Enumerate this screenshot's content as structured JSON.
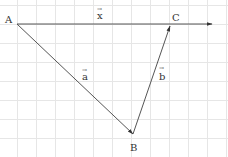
{
  "diagram": {
    "type": "vector-triangle",
    "grid": {
      "spacing": 19,
      "color": "#e6e6e6"
    },
    "line_color": "#555555",
    "points": {
      "A": {
        "label": "A",
        "x": 17,
        "y": 24
      },
      "B": {
        "label": "B",
        "x": 133,
        "y": 134
      },
      "C": {
        "label": "C",
        "x": 170,
        "y": 24
      }
    },
    "vectors": [
      {
        "name": "a",
        "label": "a",
        "from": "A",
        "to": "B"
      },
      {
        "name": "b",
        "label": "b",
        "from": "B",
        "to": "C"
      },
      {
        "name": "x",
        "label": "x",
        "from": "A",
        "to": "beyond-C",
        "end_x": 212
      }
    ],
    "labels": {
      "A": "A",
      "B": "B",
      "C": "C",
      "vec_a": "a",
      "vec_b": "b",
      "vec_x": "x",
      "arrow": "→"
    }
  }
}
